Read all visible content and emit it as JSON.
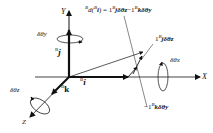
{
  "diagram": {
    "axes": {
      "x_label": "X",
      "y_label": "Y",
      "z_label": "Z"
    },
    "unit_vectors": {
      "i": {
        "prefix": "B",
        "symbol": "i"
      },
      "j": {
        "prefix": "B",
        "symbol": "j"
      },
      "k": {
        "prefix": "B",
        "symbol": "k"
      }
    },
    "rotations": {
      "x": "δθx",
      "y": "δθy",
      "z": "δθz"
    },
    "equation": {
      "lhs_prefix": "B",
      "lhs_text": "d(",
      "lhs_inner_prefix": "B",
      "lhs_inner": "i",
      "rhs": ") = 1",
      "term1_prefix": "B",
      "term1": "jδθz",
      "minus": "−1",
      "term2_prefix": "B",
      "term2": "kδθy"
    },
    "component_labels": {
      "j_term": {
        "coef": "1",
        "prefix": "B",
        "text": "jδθz"
      },
      "k_term": {
        "coef": "−1",
        "prefix": "B",
        "text": "kδθy"
      }
    },
    "colors": {
      "ink": "#111111",
      "background": "#ffffff"
    }
  }
}
